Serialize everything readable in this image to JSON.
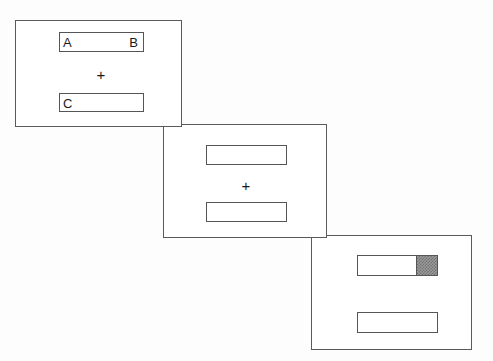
{
  "figure": {
    "type": "sequence-diagram",
    "background_color": "#fdfdfd",
    "line_color": "#5a5a5a",
    "text_color": "#1a1a1a",
    "fill_color": "#9a9a9a"
  },
  "panels": [
    {
      "id": "panel-1",
      "order": 1,
      "fixation": "+",
      "bars": [
        {
          "id": "panel-1-bar-top",
          "position": "top",
          "label_left": "A",
          "label_right": "B",
          "fill_percent": 0
        },
        {
          "id": "panel-1-bar-bottom",
          "position": "bottom",
          "label_left": "C",
          "label_right": "",
          "fill_percent": 0
        }
      ]
    },
    {
      "id": "panel-2",
      "order": 2,
      "fixation": "+",
      "bars": [
        {
          "id": "panel-2-bar-top",
          "position": "top",
          "label_left": "",
          "label_right": "",
          "fill_percent": 0
        },
        {
          "id": "panel-2-bar-bottom",
          "position": "bottom",
          "label_left": "",
          "label_right": "",
          "fill_percent": 0
        }
      ]
    },
    {
      "id": "panel-3",
      "order": 3,
      "fixation": "",
      "bars": [
        {
          "id": "panel-3-bar-top",
          "position": "top",
          "label_left": "",
          "label_right": "",
          "fill_percent": 25
        },
        {
          "id": "panel-3-bar-bottom",
          "position": "bottom",
          "label_left": "",
          "label_right": "",
          "fill_percent": 0
        }
      ]
    }
  ]
}
